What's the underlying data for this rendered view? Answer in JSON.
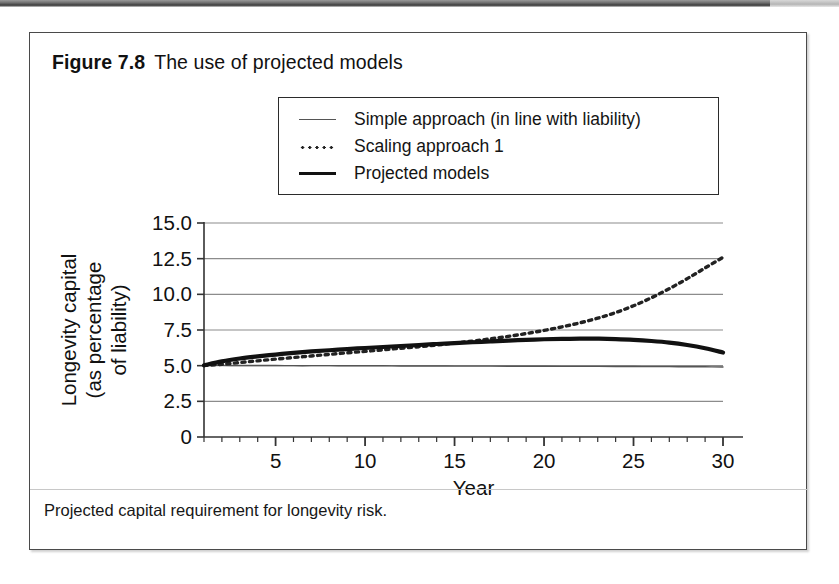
{
  "figure": {
    "number_label": "Figure 7.8",
    "title": "The use of projected models",
    "caption": "Projected capital requirement for longevity risk."
  },
  "colors": {
    "line_simple": "#555555",
    "line_scaling": "#222222",
    "line_projected": "#111111",
    "grid": "#8c8c8c",
    "axis": "#333333",
    "frame": "#4a4a4a",
    "background": "#ffffff"
  },
  "legend": {
    "position": "top-center",
    "entries": [
      {
        "label": "Simple approach (in line with liability)",
        "style": "thin-solid"
      },
      {
        "label": "Scaling approach 1",
        "style": "dotted"
      },
      {
        "label": "Projected models",
        "style": "thick-solid"
      }
    ]
  },
  "chart_data": {
    "type": "line",
    "title": "The use of projected models",
    "xlabel": "Year",
    "ylabel": "Longevity capital\n(as percentage\nof liability)",
    "ylabel_lines": [
      "Longevity capital",
      "(as percentage",
      "of liability)"
    ],
    "xlim": [
      1,
      30
    ],
    "ylim": [
      0,
      15
    ],
    "xticks": [
      5,
      10,
      15,
      20,
      25,
      30
    ],
    "xtick_labels": [
      "5",
      "10",
      "15",
      "20",
      "25",
      "30"
    ],
    "xminor_tick_interval": 1,
    "yticks": [
      0,
      2.5,
      5.0,
      7.5,
      10.0,
      12.5,
      15.0
    ],
    "ytick_labels": [
      "0",
      "2.5",
      "5.0",
      "7.5",
      "10.0",
      "12.5",
      "15.0"
    ],
    "grid": "horizontal",
    "legend_position": "above-plot",
    "x": [
      1,
      2,
      3,
      4,
      5,
      6,
      7,
      8,
      9,
      10,
      11,
      12,
      13,
      14,
      15,
      16,
      17,
      18,
      19,
      20,
      21,
      22,
      23,
      24,
      25,
      26,
      27,
      28,
      29,
      30
    ],
    "series": [
      {
        "name": "Simple approach (in line with liability)",
        "style": "thin-solid",
        "values": [
          5.02,
          5.02,
          5.01,
          5.01,
          5.01,
          5.0,
          5.0,
          5.0,
          4.99,
          4.99,
          4.99,
          4.98,
          4.98,
          4.98,
          4.97,
          4.97,
          4.97,
          4.96,
          4.96,
          4.96,
          4.95,
          4.95,
          4.95,
          4.94,
          4.94,
          4.93,
          4.93,
          4.92,
          4.92,
          4.91
        ]
      },
      {
        "name": "Scaling approach 1",
        "style": "dotted",
        "values": [
          5.02,
          5.1,
          5.22,
          5.34,
          5.46,
          5.57,
          5.68,
          5.79,
          5.9,
          6.0,
          6.11,
          6.22,
          6.33,
          6.45,
          6.58,
          6.72,
          6.88,
          7.05,
          7.25,
          7.47,
          7.72,
          8.0,
          8.33,
          8.72,
          9.2,
          9.76,
          10.4,
          11.1,
          11.85,
          12.6
        ]
      },
      {
        "name": "Projected models",
        "style": "thick-solid",
        "values": [
          5.02,
          5.3,
          5.5,
          5.65,
          5.78,
          5.9,
          6.0,
          6.08,
          6.16,
          6.24,
          6.31,
          6.38,
          6.45,
          6.52,
          6.58,
          6.64,
          6.7,
          6.76,
          6.81,
          6.85,
          6.88,
          6.9,
          6.89,
          6.86,
          6.81,
          6.73,
          6.62,
          6.45,
          6.22,
          5.92
        ]
      }
    ]
  }
}
